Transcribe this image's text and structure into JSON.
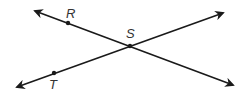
{
  "diagram": {
    "type": "intersecting-lines",
    "colors": {
      "line": "#1a1a1a",
      "label": "#333333",
      "background": "#ffffff"
    },
    "lines": [
      {
        "name": "line-RS",
        "from": [
          35,
          11
        ],
        "to": [
          233,
          85
        ]
      },
      {
        "name": "line-TS",
        "from": [
          17,
          87
        ],
        "to": [
          223,
          13
        ]
      }
    ],
    "points": [
      {
        "id": "R",
        "label": "R",
        "x": 68,
        "y": 23,
        "label_x": 68,
        "label_y": 18
      },
      {
        "id": "S",
        "label": "S",
        "x": 130,
        "y": 46,
        "label_x": 125,
        "label_y": 38
      },
      {
        "id": "T",
        "label": "T",
        "x": 54,
        "y": 73,
        "label_x": 49,
        "label_y": 88
      }
    ]
  }
}
